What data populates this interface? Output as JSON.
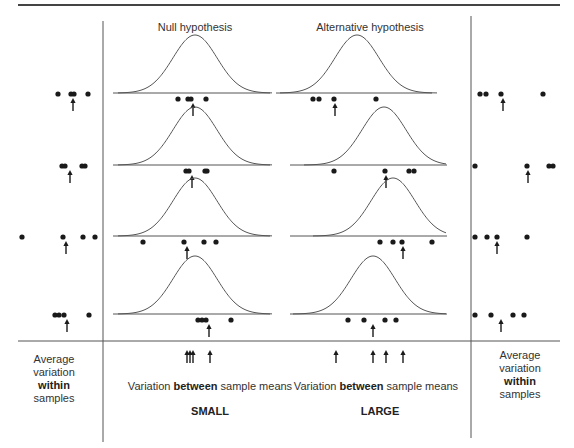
{
  "headers": {
    "null": "Null hypothesis",
    "alternative": "Alternative hypothesis"
  },
  "bottom": {
    "left_label": [
      "Average",
      "variation",
      "within",
      "samples"
    ],
    "right_label": [
      "Average",
      "variation",
      "within",
      "samples"
    ],
    "null_caption_pre": "Variation ",
    "null_caption_bold": "between",
    "null_caption_post": " sample means",
    "null_size": "SMALL",
    "alt_caption_pre": "Variation ",
    "alt_caption_bold": "between",
    "alt_caption_post": " sample means",
    "alt_size": "LARGE"
  },
  "rows": [
    {
      "baseline_y": 93,
      "null": {
        "curve_center": 195,
        "dots": [
          178,
          188,
          191,
          206
        ],
        "mean": 193
      },
      "alt": {
        "curve_center": 357,
        "dots": [
          313,
          319,
          334,
          376
        ],
        "mean": 335
      },
      "left": {
        "dots": [
          58,
          71,
          74,
          88
        ],
        "mean": 73
      },
      "right": {
        "dots": [
          480,
          486,
          501,
          543
        ],
        "mean": 503
      }
    },
    {
      "baseline_y": 165,
      "null": {
        "curve_center": 195,
        "dots": [
          186,
          189,
          205,
          207
        ],
        "mean": 192
      },
      "alt": {
        "curve_center": 384,
        "dots": [
          334,
          385,
          409,
          414
        ],
        "mean": 386
      },
      "left": {
        "dots": [
          62,
          65,
          82,
          85
        ],
        "mean": 70
      },
      "right": {
        "dots": [
          475,
          527,
          549,
          553
        ],
        "mean": 528
      }
    },
    {
      "baseline_y": 236,
      "null": {
        "curve_center": 195,
        "dots": [
          143,
          184,
          204,
          216
        ],
        "mean": 187
      },
      "alt": {
        "curve_center": 393,
        "dots": [
          380,
          393,
          402,
          432
        ],
        "mean": 403
      },
      "left": {
        "dots": [
          22,
          63,
          83,
          95
        ],
        "mean": 66
      },
      "right": {
        "dots": [
          475,
          487,
          497,
          527
        ],
        "mean": 497
      }
    },
    {
      "baseline_y": 314,
      "null": {
        "curve_center": 195,
        "dots": [
          198,
          202,
          206,
          231
        ],
        "mean": 209
      },
      "alt": {
        "curve_center": 373,
        "dots": [
          348,
          364,
          385,
          396
        ],
        "mean": 373
      },
      "left": {
        "dots": [
          55,
          59,
          64,
          89
        ],
        "mean": 67
      },
      "right": {
        "dots": [
          475,
          491,
          513,
          524
        ],
        "mean": 501
      }
    }
  ],
  "bottom_arrows": {
    "null": [
      187,
      190,
      193,
      210
    ],
    "alt": [
      336,
      373,
      386,
      403
    ]
  },
  "colors": {
    "ink": "#1a1a1a",
    "curve": "#555555",
    "rule": "#444444"
  }
}
